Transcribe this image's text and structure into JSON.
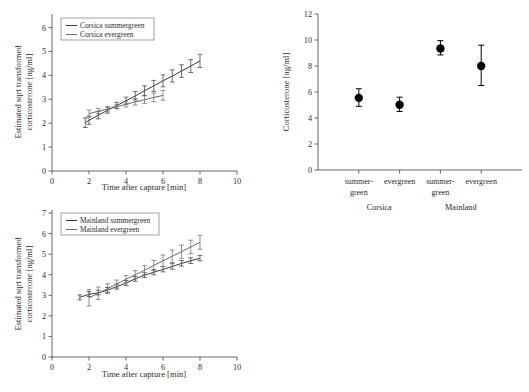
{
  "figure": {
    "panels": [
      "corsica-timecourse",
      "mainland-timecourse",
      "baseline-corticosterone"
    ]
  },
  "chart_data": [
    {
      "id": "corsica-timecourse",
      "type": "line",
      "title": "",
      "xlabel": "Time after capture [min]",
      "ylabel": "Estimated sqrt transformed corticosterone [ng/ml]",
      "ylabel_line1": "Estimated sqrt transformed",
      "ylabel_line2": "corticosterone [ng/ml]",
      "xlim": [
        0,
        10
      ],
      "ylim": [
        0,
        6.4
      ],
      "xticks": [
        0,
        2,
        4,
        6,
        8,
        10
      ],
      "yticks": [
        0,
        1,
        2,
        3,
        4,
        5,
        6
      ],
      "xticklabels": [
        "0",
        "2",
        "4",
        "6",
        "8",
        "10"
      ],
      "yticklabels": [
        "0",
        "1",
        "2",
        "3",
        "4",
        "5",
        "6"
      ],
      "grid": false,
      "legend_position": "upper-left",
      "series": [
        {
          "name": "Corsica summergreen",
          "color": "#3a3a3a",
          "x": [
            1.8,
            2.0,
            2.5,
            3.0,
            3.5,
            4.0,
            4.5,
            5.0,
            5.5,
            6.0,
            6.5,
            7.0,
            7.5,
            8.0
          ],
          "values": [
            2.02,
            2.12,
            2.33,
            2.54,
            2.74,
            2.94,
            3.14,
            3.36,
            3.56,
            3.77,
            3.97,
            4.18,
            4.39,
            4.6
          ],
          "err_low": [
            1.82,
            1.95,
            2.18,
            2.42,
            2.62,
            2.8,
            2.97,
            3.16,
            3.33,
            3.52,
            3.72,
            3.92,
            4.12,
            4.33
          ],
          "err_high": [
            2.22,
            2.3,
            2.49,
            2.67,
            2.87,
            3.09,
            3.32,
            3.56,
            3.79,
            4.02,
            4.23,
            4.44,
            4.66,
            4.88
          ]
        },
        {
          "name": "Corsica evergreen",
          "color": "#6a6a6a",
          "x": [
            2.0,
            2.5,
            3.0,
            3.5,
            4.0,
            4.5,
            5.0,
            5.5,
            6.0
          ],
          "values": [
            2.4,
            2.5,
            2.59,
            2.69,
            2.79,
            2.89,
            2.98,
            3.08,
            3.16
          ],
          "err_low": [
            2.26,
            2.39,
            2.5,
            2.6,
            2.68,
            2.76,
            2.83,
            2.9,
            2.96
          ],
          "err_high": [
            2.55,
            2.62,
            2.69,
            2.78,
            2.9,
            3.03,
            3.14,
            3.26,
            3.37
          ]
        }
      ]
    },
    {
      "id": "mainland-timecourse",
      "type": "line",
      "title": "",
      "xlabel": "Time after capture [min]",
      "ylabel": "Estimated sqrt transformed corticosterone [ng/ml]",
      "ylabel_line1": "Estimated sqrt transformed",
      "ylabel_line2": "corticosterone [ng/ml]",
      "xlim": [
        0,
        10
      ],
      "ylim": [
        0,
        7.1
      ],
      "xticks": [
        0,
        2,
        4,
        6,
        8,
        10
      ],
      "yticks": [
        0,
        1,
        2,
        3,
        4,
        5,
        6,
        7
      ],
      "xticklabels": [
        "0",
        "2",
        "4",
        "6",
        "8",
        "10"
      ],
      "yticklabels": [
        "0",
        "1",
        "2",
        "3",
        "4",
        "5",
        "6",
        "7"
      ],
      "grid": false,
      "legend_position": "upper-left",
      "series": [
        {
          "name": "Mainland summergreen",
          "color": "#3a3a3a",
          "x": [
            1.5,
            2.0,
            2.5,
            3.0,
            3.5,
            4.0,
            4.5,
            5.0,
            5.5,
            6.0,
            6.5,
            7.0,
            7.5,
            8.0
          ],
          "values": [
            2.9,
            3.05,
            3.12,
            3.25,
            3.42,
            3.6,
            3.8,
            3.98,
            4.12,
            4.26,
            4.4,
            4.55,
            4.68,
            4.8
          ],
          "err_low": [
            2.78,
            2.94,
            3.02,
            3.14,
            3.3,
            3.48,
            3.68,
            3.86,
            4.0,
            4.14,
            4.27,
            4.42,
            4.55,
            4.68
          ],
          "err_high": [
            3.02,
            3.18,
            3.25,
            3.38,
            3.55,
            3.72,
            3.92,
            4.1,
            4.25,
            4.4,
            4.54,
            4.69,
            4.82,
            4.94
          ]
        },
        {
          "name": "Mainland evergreen",
          "color": "#6a6a6a",
          "x": [
            2.0,
            2.5,
            3.0,
            3.5,
            4.0,
            4.5,
            5.0,
            5.5,
            6.0,
            6.5,
            7.0,
            7.5,
            8.0
          ],
          "values": [
            2.88,
            3.1,
            3.32,
            3.55,
            3.78,
            4.0,
            4.22,
            4.45,
            4.68,
            4.9,
            5.12,
            5.35,
            5.58
          ],
          "err_low": [
            2.48,
            2.8,
            3.08,
            3.36,
            3.6,
            3.8,
            4.0,
            4.2,
            4.4,
            4.6,
            4.8,
            5.02,
            5.24
          ],
          "err_high": [
            3.28,
            3.4,
            3.56,
            3.74,
            3.96,
            4.2,
            4.44,
            4.7,
            4.96,
            5.2,
            5.44,
            5.68,
            5.92
          ]
        }
      ]
    },
    {
      "id": "baseline-corticosterone",
      "type": "scatter",
      "title": "",
      "xlabel": "",
      "ylabel": "Corticosterone [ng/ml]",
      "ylim": [
        0,
        12
      ],
      "yticks": [
        0,
        2,
        4,
        6,
        8,
        10,
        12
      ],
      "yticklabels": [
        "0",
        "2",
        "4",
        "6",
        "8",
        "10",
        "12"
      ],
      "grid": false,
      "categories": [
        "summer-green",
        "evergreen",
        "summer-green",
        "evergreen"
      ],
      "category_lines": [
        [
          "summer-",
          "green"
        ],
        [
          "evergreen",
          ""
        ],
        [
          "summer-",
          "green"
        ],
        [
          "evergreen",
          ""
        ]
      ],
      "groups": [
        {
          "name": "Corsica",
          "span": [
            0,
            1
          ]
        },
        {
          "name": "Mainland",
          "span": [
            2,
            3
          ]
        }
      ],
      "values": [
        5.55,
        5.02,
        9.35,
        8.0
      ],
      "err_low": [
        4.9,
        4.5,
        8.85,
        6.5
      ],
      "err_high": [
        6.25,
        5.6,
        9.95,
        9.6
      ],
      "marker": "filled-circle",
      "marker_color": "#000000"
    }
  ]
}
